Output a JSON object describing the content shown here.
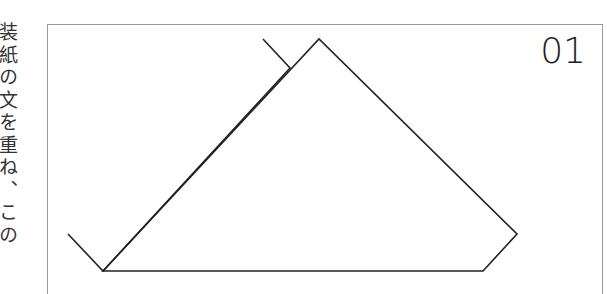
{
  "side_text": {
    "content": "装紙の文を重ね、この",
    "orientation": "vertical"
  },
  "panel": {
    "step_number": "01"
  },
  "diagram": {
    "stroke_color": "#222222",
    "stroke_width": 1.6,
    "shapes": [
      {
        "name": "back-folded-flap",
        "points": [
          [
            263,
            39
          ],
          [
            290,
            68
          ],
          [
            103,
            271
          ],
          [
            68,
            234
          ]
        ]
      },
      {
        "name": "front-pentagon",
        "points": [
          [
            319,
            39
          ],
          [
            517,
            234
          ],
          [
            483,
            271
          ],
          [
            103,
            271
          ]
        ]
      }
    ]
  }
}
